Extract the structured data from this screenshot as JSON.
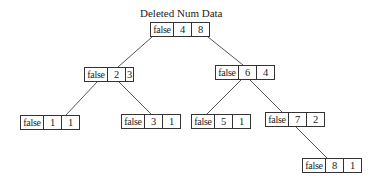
{
  "title": "Deleted Num Data",
  "colors": {
    "line": "#444444",
    "border": "#333333",
    "text": "#222222",
    "background": "#ffffff"
  },
  "tree": {
    "nodes": [
      {
        "id": "n48",
        "deleted": "false",
        "key": "4",
        "value": "8",
        "x": 150,
        "y": 22,
        "w": 60
      },
      {
        "id": "n23",
        "deleted": "false",
        "key": "2",
        "value": "3",
        "x": 84,
        "y": 67,
        "w": 50
      },
      {
        "id": "n64",
        "deleted": "false",
        "key": "6",
        "value": "4",
        "x": 215,
        "y": 65,
        "w": 60
      },
      {
        "id": "n11",
        "deleted": "false",
        "key": "1",
        "value": "1",
        "x": 20,
        "y": 115,
        "w": 60
      },
      {
        "id": "n31",
        "deleted": "false",
        "key": "3",
        "value": "1",
        "x": 121,
        "y": 114,
        "w": 60
      },
      {
        "id": "n51",
        "deleted": "false",
        "key": "5",
        "value": "1",
        "x": 191,
        "y": 114,
        "w": 60
      },
      {
        "id": "n72",
        "deleted": "false",
        "key": "7",
        "value": "2",
        "x": 265,
        "y": 112,
        "w": 60
      },
      {
        "id": "n81",
        "deleted": "false",
        "key": "8",
        "value": "1",
        "x": 302,
        "y": 158,
        "w": 60
      }
    ],
    "edges": [
      {
        "from": "n48",
        "to": "n23",
        "x1": 152,
        "y1": 37,
        "x2": 118,
        "y2": 67
      },
      {
        "from": "n48",
        "to": "n64",
        "x1": 208,
        "y1": 37,
        "x2": 243,
        "y2": 65
      },
      {
        "from": "n23",
        "to": "n11",
        "x1": 97,
        "y1": 82,
        "x2": 66,
        "y2": 115
      },
      {
        "from": "n23",
        "to": "n31",
        "x1": 119,
        "y1": 82,
        "x2": 151,
        "y2": 114
      },
      {
        "from": "n64",
        "to": "n51",
        "x1": 241,
        "y1": 80,
        "x2": 207,
        "y2": 114
      },
      {
        "from": "n64",
        "to": "n72",
        "x1": 250,
        "y1": 80,
        "x2": 282,
        "y2": 112
      },
      {
        "from": "n72",
        "to": "n81",
        "x1": 296,
        "y1": 127,
        "x2": 327,
        "y2": 158
      }
    ]
  }
}
